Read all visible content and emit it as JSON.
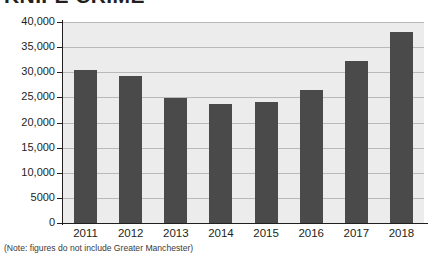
{
  "title": "KNIFE CRIME",
  "note": "(Note: figures do not include Greater Manchester)",
  "colors": {
    "bar": "#4a4a4a",
    "plot_background": "#ececec",
    "gridline": "#b9b9b9",
    "axis": "#231f20",
    "page_background": "#ffffff",
    "text": "#231f20"
  },
  "chart_data": {
    "type": "bar",
    "title": "KNIFE CRIME",
    "subtitle": "",
    "xlabel": "",
    "ylabel": "",
    "categories": [
      "2011",
      "2012",
      "2013",
      "2014",
      "2015",
      "2016",
      "2017",
      "2018"
    ],
    "values": [
      30500,
      29300,
      24900,
      23700,
      24100,
      26500,
      32300,
      38100
    ],
    "ylim": [
      0,
      40000
    ],
    "ytick_values": [
      0,
      5000,
      10000,
      15000,
      20000,
      25000,
      30000,
      35000,
      40000
    ],
    "ytick_labels": [
      "0",
      "5000",
      "10,000",
      "15,000",
      "20,000",
      "25,000",
      "30,000",
      "35,000",
      "40,000"
    ],
    "grid": true,
    "legend": false,
    "legend_position": "none",
    "annotations": [
      "(Note: figures do not include Greater Manchester)"
    ]
  }
}
